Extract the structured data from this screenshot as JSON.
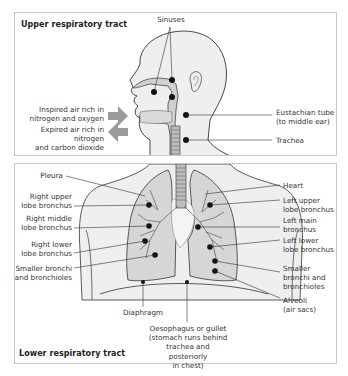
{
  "upper_tract": {
    "title": "Upper respiratory tract",
    "labels": {
      "sinuses": "Sinuses",
      "inspired_air": "Inspired air rich in\nnitrogen and oxygen",
      "expired_air": "Expired air rich in nitrogen\nand carbon dioxide",
      "eustachian_tube": "Eustachian tube\n(to middle ear)",
      "trachea": "Trachea"
    }
  },
  "lower_tract": {
    "title": "Lower respiratory tract",
    "labels": {
      "pleura": "Pleura",
      "right_upper_lobe_bronchus": "Right upper\nlobe bronchus",
      "right_middle_lobe_bronchus": "Right middle\nlobe bronchus",
      "right_lower_lobe_bronchus": "Right lower\nlobe bronchus",
      "smaller_bronchi_left_side": "Smaller bronchi\nand bronchioles",
      "heart": "Heart",
      "left_upper_lobe_bronchus": "Left upper\nlobe bronchus",
      "left_main_bronchus": "Left main\nbronchus",
      "left_lower_lobe_bronchus": "Left lower\nlobe bronchus",
      "smaller_bronchi_right_side": "Smaller\nbronchi and\nbronchioles",
      "alveoli": "Alveoli\n(air sacs)",
      "diaphragm": "Diaphragm",
      "oesophagus": "Oesophagus or gullet\n(stomach runs behind\ntrachea and posteriorly\nin chest)"
    }
  },
  "colors": {
    "border": "#c9c9c9",
    "body_fill": "#efefef",
    "lung_fill": "#d6d6d6",
    "airway_fill": "#cfcfcf",
    "arrow_fill": "#9a9a9a",
    "line": "#333333",
    "dot": "#111111"
  }
}
